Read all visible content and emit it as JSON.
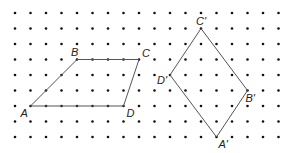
{
  "grid": {
    "cols": 18,
    "rows": 9,
    "origin_x": 15,
    "origin_y": 13,
    "spacing_x": 15.5,
    "spacing_y": 15.5,
    "dot_color": "#111111"
  },
  "shapes": [
    {
      "name": "parallelogram-ABCD",
      "stroke": "#555555",
      "vertices": [
        {
          "label": "A",
          "col": 1,
          "row": 6,
          "dx": -10,
          "dy": 11
        },
        {
          "label": "B",
          "col": 4,
          "row": 3,
          "dx": -6,
          "dy": -4
        },
        {
          "label": "C",
          "col": 8,
          "row": 3,
          "dx": 3,
          "dy": -3
        },
        {
          "label": "D",
          "col": 7,
          "row": 6,
          "dx": 3,
          "dy": 11
        }
      ]
    },
    {
      "name": "parallelogram-A'B'C'D'",
      "stroke": "#555555",
      "vertices": [
        {
          "label": "A'",
          "col": 13,
          "row": 8,
          "dx": 2,
          "dy": 11
        },
        {
          "label": "B'",
          "col": 15,
          "row": 5,
          "dx": -2,
          "dy": 11
        },
        {
          "label": "C'",
          "col": 12,
          "row": 1,
          "dx": -5,
          "dy": -4
        },
        {
          "label": "D'",
          "col": 10,
          "row": 4,
          "dx": -13,
          "dy": 9
        }
      ]
    }
  ]
}
